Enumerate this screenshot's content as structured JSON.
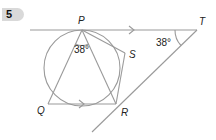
{
  "question": {
    "number": "5"
  },
  "diagram": {
    "points": {
      "P": {
        "label": "P",
        "x": 82,
        "y": 30
      },
      "T": {
        "label": "T",
        "x": 197,
        "y": 30
      },
      "S": {
        "label": "S",
        "x": 125,
        "y": 53
      },
      "R": {
        "label": "R",
        "x": 116,
        "y": 104
      },
      "Q": {
        "label": "Q",
        "x": 48,
        "y": 104
      }
    },
    "circle": {
      "cx": 82,
      "cy": 68,
      "r": 38
    },
    "angles": {
      "QPR": "38°",
      "PTR": "38°"
    },
    "parallel_marks": [
      "PT",
      "QR"
    ],
    "colors": {
      "line": "#9a9a9a",
      "text": "#222222",
      "badge": "#d9d9d9"
    }
  }
}
